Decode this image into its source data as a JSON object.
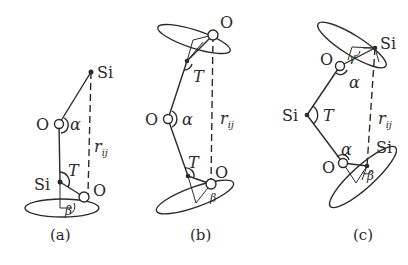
{
  "figure": {
    "panels": [
      {
        "id": "a",
        "caption": "(a)",
        "atoms": {
          "si_top": "Si",
          "o_mid": "O",
          "si_low": "Si",
          "o_low": "O"
        },
        "angles": {
          "alpha": "α",
          "T": "T",
          "beta": "β"
        },
        "distance": {
          "r": "r",
          "sub": "ij"
        }
      },
      {
        "id": "b",
        "caption": "(b)",
        "atoms": {
          "o_top": "O",
          "o_mid": "O",
          "o_low": "O"
        },
        "angles": {
          "T_top": "T",
          "alpha": "α",
          "T_low": "T",
          "beta": "β"
        },
        "distance": {
          "r": "r",
          "sub": "ij"
        }
      },
      {
        "id": "c",
        "caption": "(c)",
        "atoms": {
          "si_top": "Si",
          "o_top": "O",
          "si_mid": "Si",
          "o_low": "O",
          "si_low": "Si"
        },
        "angles": {
          "gamma": "γ",
          "alpha_top": "α",
          "T": "T",
          "alpha_low": "α",
          "beta": "β"
        },
        "distance": {
          "r": "r",
          "sub": "ij"
        }
      }
    ]
  }
}
